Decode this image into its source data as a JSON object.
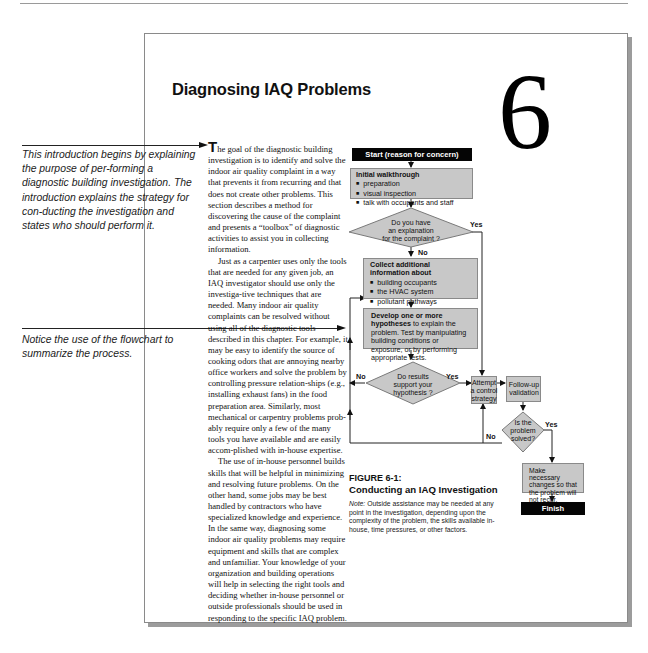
{
  "page": {
    "title": "Diagnosing IAQ Problems",
    "chapter_number": "6"
  },
  "annotations": [
    {
      "text": "This introduction begins by explaining the purpose of per-forming a diagnostic building investigation. The introduction explains the strategy for con-ducting the investigation and states who should perform it."
    },
    {
      "text": "Notice the use of the flowchart to summarize the process."
    }
  ],
  "body": {
    "dropcap": "T",
    "paragraphs": [
      "he goal of the diagnostic building investigation is to identify and solve the indoor air quality complaint in a way that prevents it from recurring and that does not create other problems.  This section describes a method for discovering the cause of the complaint and presents a “toolbox” of diagnostic activities to assist you in collecting information.",
      "Just as a carpenter uses only the tools that are needed for any given job, an IAQ investigator should use only the investiga-tive techniques that are needed.  Many indoor air quality complaints can be resolved without using all of the diagnostic tools described in this chapter.  For example, it may be easy to identify the source of cooking odors that are annoying nearby office workers and solve the problem by controlling pressure relation-ships (e.g., installing exhaust fans) in the food preparation area.  Similarly, most mechanical or carpentry problems prob-ably require only a few of the many tools you have available and are easily accom-plished with in-house expertise.",
      "The use of in-house personnel builds skills that will be helpful in minimizing and resolving future problems.  On the other hand, some jobs may be best handled by contractors who have specialized knowledge and experience.  In the same way, diagnosing some indoor air quality problems may require equipment and skills that are complex and unfamiliar.  Your knowledge of your organization and building operations will help in selecting the right tools and deciding whether in-house personnel or outside professionals should be used in responding to the specific IAQ problem."
    ]
  },
  "flowchart": {
    "start": "Start (reason for concern)",
    "walkthrough": {
      "heading": "Initial walkthrough",
      "items": [
        "preparation",
        "visual inspection",
        "talk with occupants and staff"
      ]
    },
    "decision1": {
      "lines": [
        "Do you have",
        "an explanation",
        "for the complaint ?"
      ],
      "yes": "Yes",
      "no": "No"
    },
    "collect": {
      "heading_lines": [
        "Collect additional",
        "information about"
      ],
      "items": [
        "building occupants",
        "the HVAC system",
        "pollutant pathways",
        "pollutant sources"
      ],
      "sub": "(sample contaminants if needed)"
    },
    "hypothesis": {
      "heading": "Develop one or more hypotheses",
      "text": "to explain the problem.  Test by manipulating building conditions or exposure, or by performing appropriate tests."
    },
    "decision2": {
      "lines": [
        "Do results",
        "support your",
        "hypothesis ?"
      ],
      "yes": "Yes",
      "no": "No"
    },
    "attempt": {
      "lines": [
        "Attempt",
        "a control",
        "strategy"
      ]
    },
    "followup": {
      "lines": [
        "Follow-up",
        "validation"
      ]
    },
    "decision3": {
      "lines": [
        "Is the",
        "problem",
        "solved?"
      ],
      "yes": "Yes",
      "no": "No"
    },
    "changes": {
      "text": "Make necessary changes so that the problem will not recur."
    },
    "finish": "Finish"
  },
  "figure": {
    "number": "FIGURE 6-1:",
    "title": "Conducting an IAQ Investigation",
    "note_label": "Note:",
    "note_text": " Outside assistance may be needed at any point in the investigation, depending upon the complexity of the problem, the skills available in-house, time pressures, or other factors."
  }
}
